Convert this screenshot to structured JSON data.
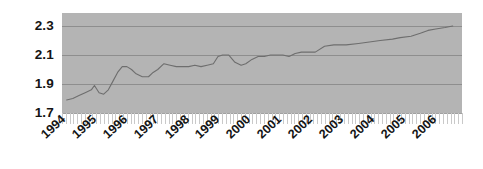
{
  "chart_data": {
    "type": "line",
    "title": "",
    "subtitle": "",
    "xlabel": "",
    "ylabel": "",
    "grid": true,
    "legend_position": "none",
    "plot_background_color": "#b4b4b4",
    "gridline_color": "#8e8e8e",
    "series_color": "#6e6e6e",
    "axis_text_color": "#141414",
    "ylim": [
      1.7,
      2.39
    ],
    "ytick_labels": [
      "2.3",
      "2.1",
      "1.9",
      "1.7"
    ],
    "ytick_values": [
      2.3,
      2.1,
      1.9,
      1.7
    ],
    "xlim": [
      "1994",
      "2006"
    ],
    "xtick_labels": [
      "1994",
      "1995",
      "1996",
      "1997",
      "1998",
      "1999",
      "2000",
      "2001",
      "2002",
      "2003",
      "2004",
      "2005",
      "2006"
    ],
    "x_minor_tick_count": 105,
    "series": [
      {
        "name": "value",
        "x": [
          1994.15,
          1994.35,
          1994.55,
          1994.75,
          1994.95,
          1995.05,
          1995.2,
          1995.35,
          1995.5,
          1995.65,
          1995.8,
          1995.95,
          1996.1,
          1996.25,
          1996.4,
          1996.6,
          1996.8,
          1996.95,
          1997.1,
          1997.3,
          1997.5,
          1997.7,
          1997.9,
          1998.1,
          1998.3,
          1998.5,
          1998.7,
          1998.9,
          1999.05,
          1999.2,
          1999.4,
          1999.6,
          1999.8,
          1999.95,
          2000.15,
          2000.35,
          2000.55,
          2000.75,
          2000.95,
          2001.15,
          2001.35,
          2001.55,
          2001.75,
          2001.95,
          2002.2,
          2002.5,
          2002.8,
          2003.2,
          2003.6,
          2003.95,
          2004.3,
          2004.7,
          2004.95,
          2005.3,
          2005.6,
          2005.85,
          2006.1,
          2006.4,
          2006.65
        ],
        "values": [
          1.79,
          1.8,
          1.82,
          1.84,
          1.86,
          1.89,
          1.84,
          1.83,
          1.86,
          1.92,
          1.98,
          2.02,
          2.02,
          2.0,
          1.97,
          1.95,
          1.95,
          1.98,
          2.0,
          2.04,
          2.03,
          2.02,
          2.02,
          2.02,
          2.03,
          2.02,
          2.03,
          2.04,
          2.09,
          2.1,
          2.1,
          2.05,
          2.03,
          2.04,
          2.07,
          2.09,
          2.09,
          2.1,
          2.1,
          2.1,
          2.09,
          2.11,
          2.12,
          2.12,
          2.12,
          2.16,
          2.17,
          2.17,
          2.18,
          2.19,
          2.2,
          2.21,
          2.22,
          2.23,
          2.25,
          2.27,
          2.28,
          2.29,
          2.3
        ]
      }
    ]
  }
}
